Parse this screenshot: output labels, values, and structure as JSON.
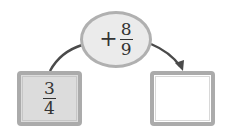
{
  "diagram": {
    "operation": {
      "operator": "+",
      "numerator": "8",
      "denominator": "9"
    },
    "input": {
      "numerator": "3",
      "denominator": "4"
    },
    "output": {
      "value": ""
    }
  },
  "colors": {
    "oval_fill": "#ebebeb",
    "border": "#ababab",
    "input_fill": "#dcdcdc",
    "output_fill": "#ffffff",
    "arrow": "#4a4a4a"
  }
}
